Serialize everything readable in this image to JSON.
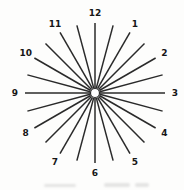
{
  "figure": {
    "kind": "clock-dial-chart",
    "center": {
      "x": 95,
      "y": 93
    },
    "hub": {
      "radius": 4.5,
      "fill": "#ffffff",
      "stroke_width": 1.2
    },
    "spokes": {
      "count": 24,
      "angle_step_deg": 15,
      "inner_radius": 5,
      "outer_radius": 70,
      "stroke_width": 1.5
    },
    "labels": {
      "radius": 80,
      "font_size": 9,
      "items": [
        {
          "text": "12",
          "clock_hour": 12
        },
        {
          "text": "1",
          "clock_hour": 1
        },
        {
          "text": "2",
          "clock_hour": 2
        },
        {
          "text": "3",
          "clock_hour": 3
        },
        {
          "text": "4",
          "clock_hour": 4
        },
        {
          "text": "5",
          "clock_hour": 5
        },
        {
          "text": "6",
          "clock_hour": 6
        },
        {
          "text": "7",
          "clock_hour": 7
        },
        {
          "text": "8",
          "clock_hour": 8
        },
        {
          "text": "9",
          "clock_hour": 9
        },
        {
          "text": "10",
          "clock_hour": 10
        },
        {
          "text": "11",
          "clock_hour": 11
        }
      ]
    },
    "colors": {
      "line": "#2a2a2a",
      "label": "#161616",
      "background": "#fdfdfc"
    }
  }
}
